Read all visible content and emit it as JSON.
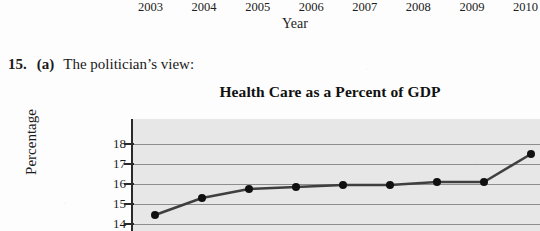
{
  "previous_figure": {
    "x_tick_labels": [
      "2003",
      "2004",
      "2005",
      "2006",
      "2007",
      "2008",
      "2009",
      "2010"
    ],
    "x_axis_title": "Year"
  },
  "problem": {
    "number": "15.",
    "part": "(a)",
    "text": "The politician’s view:"
  },
  "chart_data": {
    "type": "line",
    "title": "Health Care as a Percent of GDP",
    "xlabel": "Year",
    "ylabel": "Percentage",
    "x": [
      2003,
      2004,
      2005,
      2006,
      2007,
      2008,
      2009,
      2010,
      2011
    ],
    "categories": [
      "2003",
      "2004",
      "2005",
      "2006",
      "2007",
      "2008",
      "2009",
      "2010",
      "2011"
    ],
    "values": [
      14.45,
      15.3,
      15.75,
      15.85,
      15.95,
      15.95,
      16.1,
      16.1,
      17.5
    ],
    "series": [
      {
        "name": "Health care as a percent of GDP",
        "values": [
          14.45,
          15.3,
          15.75,
          15.85,
          15.95,
          15.95,
          16.1,
          16.1,
          17.5
        ]
      }
    ],
    "y_tick_labels": [
      "18",
      "17",
      "16",
      "15",
      "14"
    ],
    "y_ticks": [
      18,
      17,
      16,
      15,
      14
    ],
    "ylim": [
      13.6,
      18.45
    ],
    "grid": true,
    "legend": "none",
    "plot_background": "#e7e7e7",
    "line_color": "#3f3f3f",
    "marker_color": "#101010",
    "note": "Chart is cropped at the bottom of the screenshot; y-axis label reads as “ercentage” because the leading P is cut off at the image edge."
  },
  "colors": {
    "page_background": "#fdfdfd",
    "text": "#1a1a1a",
    "gridline": "#8d8d8d",
    "axis": "#2a2a2a"
  }
}
